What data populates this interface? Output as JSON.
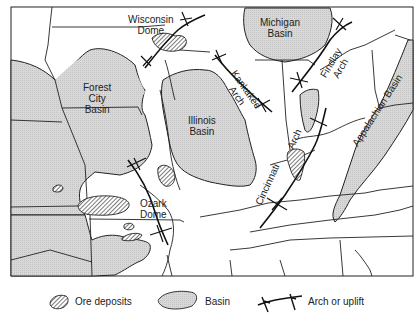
{
  "map": {
    "colors": {
      "basin_fill": "#d6d6d6",
      "background": "#ffffff",
      "line": "#222222",
      "ore_hatch": "#333333"
    },
    "labels": {
      "wisconsin_dome": [
        "Wisconsin",
        "Dome"
      ],
      "michigan_basin": [
        "Michigan",
        "Basin"
      ],
      "forest_city_basin": [
        "Forest",
        "City",
        "Basin"
      ],
      "illinois_basin": [
        "Illinois",
        "Basin"
      ],
      "kankakee_arch": [
        "Kankakee",
        "Arch"
      ],
      "findlay_arch": [
        "Findlay",
        "Arch"
      ],
      "appalachian_basin": "Appalachian Basin",
      "cincinnati_arch": [
        "Cincinnati",
        "Arch"
      ],
      "ozark_dome": [
        "Ozark",
        "Dome"
      ]
    }
  },
  "legend": {
    "items": [
      {
        "symbol": "ore-hatch",
        "label": "Ore deposits"
      },
      {
        "symbol": "basin-fill",
        "label": "Basin"
      },
      {
        "symbol": "arch-line",
        "label": "Arch or uplift"
      }
    ]
  }
}
